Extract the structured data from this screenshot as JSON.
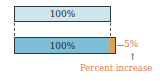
{
  "diagram": {
    "top_bar": {
      "label": "100%",
      "color": "#cfe5ea"
    },
    "bottom_bar": {
      "label": "100%",
      "color": "#7fbfd6"
    },
    "increase_segment": {
      "color": "#e3a04a"
    },
    "increase_label": "5%",
    "arrow_glyph": "↑",
    "caption": "Percent increase",
    "accent_color": "#d87a4a"
  }
}
